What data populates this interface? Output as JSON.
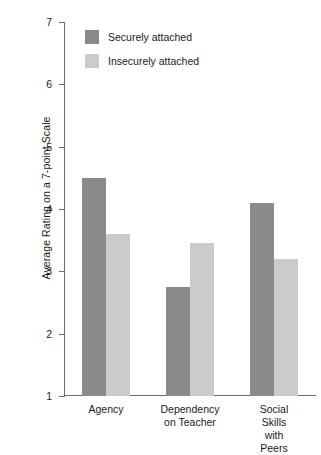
{
  "chart_data": {
    "type": "bar",
    "title": "",
    "xlabel": "",
    "ylabel": "Average Rating on a 7-point Scale",
    "ylim": [
      1,
      7
    ],
    "yticks": [
      1,
      2,
      3,
      4,
      5,
      6,
      7
    ],
    "ytick_labels": [
      "1",
      "2",
      "3",
      "4",
      "5",
      "6",
      "7"
    ],
    "grid": false,
    "legend_position": "top-left-inside",
    "categories": [
      "Agency",
      "Dependency\non Teacher",
      "Social Skills\nwith Peers"
    ],
    "category_labels": [
      {
        "line1": "Agency",
        "line2": ""
      },
      {
        "line1": "Dependency",
        "line2": "on Teacher"
      },
      {
        "line1": "Social Skills",
        "line2": "with Peers"
      }
    ],
    "series": [
      {
        "name": "Securely attached",
        "color": "#8a8a8a",
        "values": [
          4.5,
          2.75,
          4.1
        ]
      },
      {
        "name": "Insecurely attached",
        "color": "#cbcbcb",
        "values": [
          3.6,
          3.45,
          3.2
        ]
      }
    ]
  },
  "legend": {
    "items": [
      {
        "label": "Securely attached",
        "color": "#8a8a8a"
      },
      {
        "label": "Insecurely attached",
        "color": "#cbcbcb"
      }
    ]
  },
  "axes": {
    "y_title": "Average Rating on a 7-point Scale",
    "y_tick_7": "7",
    "y_tick_6": "6",
    "y_tick_5": "5",
    "y_tick_4": "4",
    "y_tick_3": "3",
    "y_tick_2": "2",
    "y_tick_1": "1"
  },
  "colors": {
    "secure": "#8a8a8a",
    "insecure": "#cbcbcb",
    "axis": "#6e6e6e",
    "text": "#1a1a1a",
    "background": "#ffffff"
  }
}
